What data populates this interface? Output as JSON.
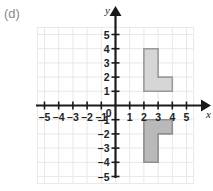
{
  "figure": {
    "part_label": "(d)",
    "background": "#ffffff",
    "grid_color": "#e8e8e8",
    "axis_color": "#1a1a1a",
    "tick_label_color": "#222222"
  },
  "chart_data": {
    "type": "scatter",
    "title": "",
    "subtitle": "",
    "xlabel": "x",
    "ylabel": "y",
    "xlim": [
      -5.5,
      5.5
    ],
    "ylim": [
      -5.5,
      5.5
    ],
    "grid": true,
    "legend": "none",
    "origin_label": "0",
    "x_ticks": [
      -5,
      -4,
      -3,
      -2,
      -1,
      1,
      2,
      3,
      4,
      5
    ],
    "x_tick_labels": [
      "–5",
      "–4",
      "–3",
      "–2",
      "–1",
      "1",
      "2",
      "3",
      "4",
      "5"
    ],
    "y_ticks": [
      5,
      4,
      3,
      2,
      1,
      -1,
      -2,
      -3,
      -4,
      -5
    ],
    "y_tick_labels": [
      "5",
      "4",
      "3",
      "2",
      "1",
      "–1",
      "–2",
      "–3",
      "–4",
      "–5"
    ],
    "annotations": [],
    "shapes": [
      {
        "name": "upper-l-shape",
        "fill": "#d6d6d6",
        "stroke": "#9a9a9a",
        "vertices": [
          [
            2,
            4
          ],
          [
            3,
            4
          ],
          [
            3,
            2
          ],
          [
            4,
            2
          ],
          [
            4,
            1
          ],
          [
            2,
            1
          ]
        ]
      },
      {
        "name": "lower-l-shape",
        "fill": "#b9b9b9",
        "stroke": "#8f8f8f",
        "vertices": [
          [
            2,
            -1
          ],
          [
            4,
            -1
          ],
          [
            4,
            -2
          ],
          [
            3,
            -2
          ],
          [
            3,
            -4
          ],
          [
            2,
            -4
          ]
        ]
      }
    ]
  }
}
